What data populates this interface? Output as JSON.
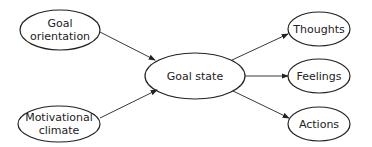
{
  "nodes": {
    "goal_orientation": {
      "line1": "Goal",
      "line2": "orientation"
    },
    "motivational_climate": {
      "line1": "Motivational",
      "line2": "climate"
    },
    "goal_state": {
      "label": "Goal state"
    },
    "thoughts": {
      "label": "Thoughts"
    },
    "feelings": {
      "label": "Feelings"
    },
    "actions": {
      "label": "Actions"
    }
  },
  "colors": {
    "stroke": "#222222",
    "text": "#222222",
    "background": "#ffffff"
  }
}
